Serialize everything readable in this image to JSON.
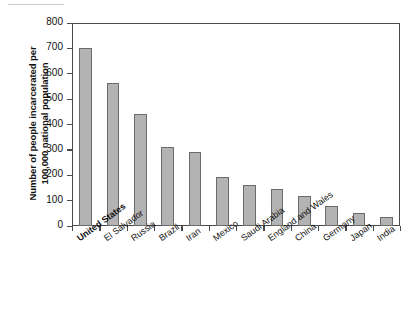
{
  "chart_data": {
    "type": "bar",
    "title": "",
    "xlabel": "",
    "ylabel": "Number of people incarcerated per\n100,000 national population",
    "ylim": [
      0,
      800
    ],
    "yticks": [
      0,
      100,
      200,
      300,
      400,
      500,
      600,
      700,
      800
    ],
    "ytick_labels": [
      "0",
      "100",
      "200",
      "300",
      "400",
      "500",
      "600",
      "700",
      "800"
    ],
    "grid": false,
    "legend": null,
    "bar_color": "#b3b3b3",
    "bar_edge_color": "#6b6b6b",
    "axis_color": "#4a4a4a",
    "categories": [
      "United States",
      "El Salvador",
      "Russia",
      "Brazil",
      "Iran",
      "Mexico",
      "Saudi Arabia",
      "England and Wales",
      "China",
      "Germany",
      "Japan",
      "India"
    ],
    "emphasized_categories": [
      "United States"
    ],
    "values": [
      700,
      565,
      440,
      310,
      290,
      195,
      160,
      145,
      120,
      80,
      50,
      35
    ]
  }
}
